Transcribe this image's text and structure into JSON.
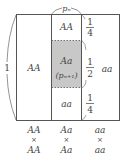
{
  "diagram": {
    "top_label": "pₙ",
    "left_label": "1",
    "column_1": {
      "label": "AA"
    },
    "column_2": {
      "top": "AA",
      "middle": "Aa",
      "middle_sub": "(pₙ₊₁)",
      "bottom": "aa"
    },
    "column_3": {
      "label": "aa"
    },
    "fractions": {
      "top": {
        "num": "1",
        "den": "4"
      },
      "middle": {
        "num": "1",
        "den": "2"
      },
      "bottom": {
        "num": "1",
        "den": "4"
      }
    },
    "crosses": [
      {
        "top": "AA",
        "x": "×",
        "bottom": "AA"
      },
      {
        "top": "Aa",
        "x": "×",
        "bottom": "Aa"
      },
      {
        "top": "aa",
        "x": "×",
        "bottom": "aa"
      }
    ],
    "colors": {
      "shade": "#c8c8c8",
      "line": "#555555"
    }
  }
}
